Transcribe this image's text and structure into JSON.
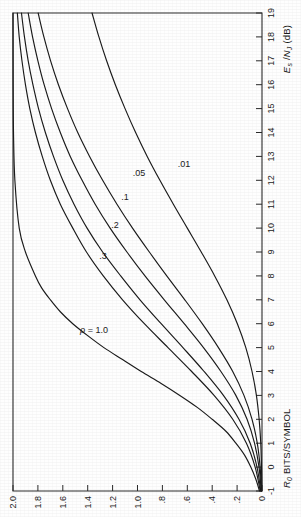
{
  "figure": {
    "kind": "line-chart",
    "orientation_note": "landscape chart printed rotated 90 degrees counter-clockwise on the page",
    "background_color": "#fefefe",
    "line_color": "#1a1a1a",
    "axis_color": "#2b2b2b"
  },
  "chart_data": {
    "type": "line",
    "title": "",
    "subtitle": "",
    "xlabel": "Es /NJ (dB)",
    "xlabel_parts": {
      "main": "E",
      "main_sub": "s",
      "sep": " /",
      "second": "N",
      "second_sub": "J",
      "unit": " (dB)"
    },
    "ylabel": "R0 BITS/SYMBOL",
    "ylabel_parts": {
      "main": "R",
      "main_sub": "0",
      "rest": " BITS/SYMBOL"
    },
    "xlim": [
      -1,
      19
    ],
    "ylim": [
      0,
      2.0
    ],
    "xticks": [
      -1,
      0,
      1,
      2,
      3,
      4,
      5,
      6,
      7,
      8,
      9,
      10,
      11,
      12,
      13,
      14,
      15,
      16,
      17,
      18,
      19
    ],
    "xticklabels": [
      "-1",
      "0",
      "1",
      "2",
      "3",
      "4",
      "5",
      "6",
      "7",
      "8",
      "9",
      "10",
      "11",
      "12",
      "13",
      "14",
      "15",
      "16",
      "17",
      "18",
      "19"
    ],
    "yticks": [
      0,
      0.2,
      0.4,
      0.6,
      0.8,
      1.0,
      1.2,
      1.4,
      1.6,
      1.8,
      2.0
    ],
    "yticklabels": [
      "0",
      ".2",
      ".4",
      ".6",
      ".8",
      "1.0",
      "1.2",
      "1.4",
      "1.6",
      "1.8",
      "2.0"
    ],
    "grid": false,
    "legend": "none (curves labelled inline)",
    "series_parameter_symbol": "ρ",
    "series": [
      {
        "name": "ρ = 1.0",
        "label": "ρ = 1.0",
        "x": [
          -1,
          -0.5,
          0,
          0.5,
          1,
          1.5,
          2,
          2.5,
          3,
          3.5,
          4,
          4.5,
          5,
          5.5,
          6,
          6.5,
          7,
          7.5,
          8,
          9,
          10,
          12,
          14,
          16,
          19
        ],
        "y": [
          0.02,
          0.05,
          0.09,
          0.14,
          0.21,
          0.29,
          0.4,
          0.52,
          0.66,
          0.81,
          0.97,
          1.12,
          1.27,
          1.4,
          1.52,
          1.62,
          1.7,
          1.77,
          1.82,
          1.9,
          1.95,
          1.985,
          1.996,
          1.999,
          2.0
        ]
      },
      {
        "name": "ρ = 0.3",
        "label": ".3",
        "x": [
          -1,
          0,
          1,
          2,
          3,
          4,
          5,
          6,
          7,
          8,
          9,
          10,
          11,
          12,
          13,
          14,
          15,
          16,
          17,
          18,
          19
        ],
        "y": [
          0.014,
          0.055,
          0.125,
          0.235,
          0.385,
          0.565,
          0.755,
          0.945,
          1.12,
          1.275,
          1.41,
          1.52,
          1.62,
          1.7,
          1.765,
          1.82,
          1.865,
          1.9,
          1.928,
          1.95,
          1.965
        ]
      },
      {
        "name": "ρ = 0.2",
        "label": ".2",
        "x": [
          -1,
          0,
          1,
          2,
          3,
          4,
          5,
          6,
          7,
          8,
          9,
          10,
          11,
          12,
          13,
          14,
          15,
          16,
          17,
          18,
          19
        ],
        "y": [
          0.01,
          0.04,
          0.095,
          0.185,
          0.31,
          0.465,
          0.635,
          0.81,
          0.98,
          1.135,
          1.28,
          1.405,
          1.51,
          1.6,
          1.675,
          1.74,
          1.795,
          1.84,
          1.878,
          1.908,
          1.932
        ]
      },
      {
        "name": "ρ = 0.1",
        "label": ".1",
        "x": [
          -1,
          0,
          1,
          2,
          3,
          4,
          5,
          6,
          7,
          8,
          9,
          10,
          11,
          12,
          13,
          14,
          15,
          16,
          17,
          18,
          19
        ],
        "y": [
          0.006,
          0.024,
          0.06,
          0.12,
          0.21,
          0.33,
          0.47,
          0.625,
          0.785,
          0.94,
          1.085,
          1.22,
          1.34,
          1.445,
          1.54,
          1.62,
          1.69,
          1.75,
          1.8,
          1.843,
          1.878
        ]
      },
      {
        "name": "ρ = 0.05",
        "label": ".05",
        "x": [
          -1,
          0,
          1,
          2,
          3,
          4,
          5,
          6,
          7,
          8,
          9,
          10,
          11,
          12,
          13,
          14,
          15,
          16,
          17,
          18,
          19
        ],
        "y": [
          0.004,
          0.015,
          0.038,
          0.08,
          0.145,
          0.235,
          0.35,
          0.48,
          0.62,
          0.765,
          0.905,
          1.04,
          1.165,
          1.28,
          1.385,
          1.48,
          1.562,
          1.635,
          1.698,
          1.752,
          1.798
        ]
      },
      {
        "name": "ρ = 0.01",
        "label": ".01",
        "x": [
          -1,
          0,
          1,
          2,
          3,
          4,
          5,
          6,
          7,
          8,
          9,
          10,
          11,
          12,
          13,
          14,
          15,
          16,
          17,
          18,
          19
        ],
        "y": [
          0.001,
          0.004,
          0.01,
          0.023,
          0.045,
          0.08,
          0.13,
          0.198,
          0.282,
          0.38,
          0.488,
          0.6,
          0.712,
          0.82,
          0.922,
          1.015,
          1.1,
          1.178,
          1.248,
          1.31,
          1.365
        ]
      }
    ],
    "annotations": [
      {
        "text": "ρ = 1.0",
        "target_series": "ρ = 1.0"
      },
      {
        "text": ".3",
        "target_series": "ρ = 0.3"
      },
      {
        "text": ".2",
        "target_series": "ρ = 0.2"
      },
      {
        "text": ".1",
        "target_series": "ρ = 0.1"
      },
      {
        "text": ".05",
        "target_series": "ρ = 0.05"
      },
      {
        "text": ".01",
        "target_series": "ρ = 0.01"
      }
    ]
  }
}
